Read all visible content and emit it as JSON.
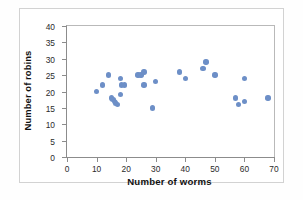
{
  "chart_data": {
    "type": "scatter",
    "title": "",
    "xlabel": "Number of worms",
    "ylabel": "Number of robins",
    "xlim": [
      0,
      70
    ],
    "ylim": [
      0,
      40
    ],
    "xticks": [
      0,
      10,
      20,
      30,
      40,
      50,
      60,
      70
    ],
    "yticks": [
      0,
      5,
      10,
      15,
      20,
      25,
      30,
      35,
      40
    ],
    "grid": false,
    "legend": null,
    "marker_color": "#6d8fc7",
    "axis_color": "#8c8c8c",
    "points": [
      {
        "x": 10,
        "y": 20
      },
      {
        "x": 12,
        "y": 22
      },
      {
        "x": 14,
        "y": 25
      },
      {
        "x": 15,
        "y": 18
      },
      {
        "x": 15.5,
        "y": 17.5
      },
      {
        "x": 16,
        "y": 17
      },
      {
        "x": 16.5,
        "y": 16.5
      },
      {
        "x": 17,
        "y": 16
      },
      {
        "x": 18,
        "y": 24
      },
      {
        "x": 18,
        "y": 19
      },
      {
        "x": 18.5,
        "y": 22
      },
      {
        "x": 19.5,
        "y": 22
      },
      {
        "x": 24,
        "y": 25
      },
      {
        "x": 25,
        "y": 25
      },
      {
        "x": 26,
        "y": 26
      },
      {
        "x": 26,
        "y": 22
      },
      {
        "x": 29,
        "y": 15
      },
      {
        "x": 30,
        "y": 23
      },
      {
        "x": 38,
        "y": 26
      },
      {
        "x": 40,
        "y": 24
      },
      {
        "x": 46,
        "y": 27
      },
      {
        "x": 47,
        "y": 29
      },
      {
        "x": 50,
        "y": 25
      },
      {
        "x": 57,
        "y": 18
      },
      {
        "x": 58,
        "y": 16
      },
      {
        "x": 60,
        "y": 17
      },
      {
        "x": 60,
        "y": 24
      },
      {
        "x": 68,
        "y": 18
      }
    ]
  }
}
